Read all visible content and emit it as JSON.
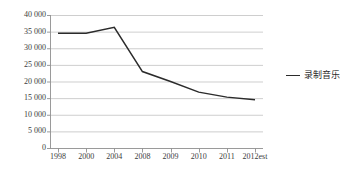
{
  "chart_data": {
    "type": "line",
    "title": "",
    "subtitle": "",
    "xlabel": "",
    "ylabel": "",
    "categories": [
      "1998",
      "2000",
      "2004",
      "2008",
      "2009",
      "2010",
      "2011",
      "2012est"
    ],
    "series": [
      {
        "name": "录制音乐",
        "color": "#2b2b2b",
        "values": [
          34500,
          34500,
          36300,
          23000,
          20000,
          16800,
          15300,
          14500
        ]
      }
    ],
    "ylim": [
      0,
      40000
    ],
    "ytick_values": [
      0,
      5000,
      10000,
      15000,
      20000,
      25000,
      30000,
      35000,
      40000
    ],
    "ytick_labels": [
      "0",
      "5 000",
      "10 000",
      "15 000",
      "20 000",
      "25 000",
      "30 000",
      "35 000",
      "40 000"
    ],
    "grid": {
      "horizontal": true,
      "vertical": false,
      "color": "#b9b9b9"
    },
    "axis_color": "#8f8f8f",
    "legend": {
      "position": "right",
      "entries": [
        {
          "label": "录制音乐",
          "marker": "line",
          "color": "#2b2b2b"
        }
      ]
    },
    "background": "#ffffff"
  }
}
